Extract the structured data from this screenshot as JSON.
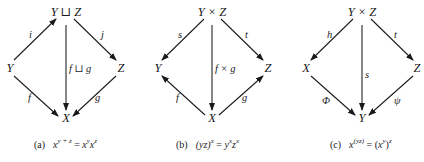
{
  "diagrams": {
    "a": {
      "nodes": {
        "top": "Y ⊔ Z",
        "left": "Y",
        "right": "Z",
        "bottom": "X"
      },
      "labels": {
        "top_left": "i",
        "top_right": "j",
        "vertical": "f ⊔ g",
        "bottom_left": "f",
        "bottom_right": "g"
      },
      "caption": {
        "tag": "(a)",
        "lhs_base": "x",
        "lhs_exp": "y + z",
        "eq": " = ",
        "r1_base": "x",
        "r1_exp": "y",
        "r2_base": "x",
        "r2_exp": "z"
      }
    },
    "b": {
      "nodes": {
        "top": "Y × Z",
        "left": "Y",
        "right": "Z",
        "bottom": "X"
      },
      "labels": {
        "top_left": "s",
        "top_right": "t",
        "vertical": "f × g",
        "bottom_left": "f",
        "bottom_right": "g"
      },
      "caption": {
        "tag": "(b)",
        "lhs": "(yz)",
        "lhs_exp": "x",
        "eq": " = ",
        "r1_base": "y",
        "r1_exp": "x",
        "r2_base": "z",
        "r2_exp": "x"
      }
    },
    "c": {
      "nodes": {
        "top": "Y × Z",
        "left": "X",
        "right": "Z",
        "bottom": "Y"
      },
      "labels": {
        "top_left": "h",
        "top_right": "t",
        "vertical": "s",
        "bottom_left": "Φ",
        "bottom_right": "ψ"
      },
      "caption": {
        "tag": "(c)",
        "lhs_base": "x",
        "lhs_exp": "(yz)",
        "eq": " = ",
        "r_open": "(",
        "r_base": "x",
        "r_inner_exp": "y",
        "r_close": ")",
        "r_exp": "z"
      }
    }
  }
}
